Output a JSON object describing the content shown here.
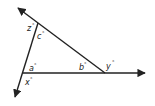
{
  "diagram": {
    "type": "triangle-with-extended-sides",
    "colors": {
      "line": "#222222",
      "background": "#ffffff"
    },
    "vertices": {
      "top": {
        "x": 38,
        "y": 23
      },
      "bottom_left": {
        "x": 23,
        "y": 73
      },
      "right": {
        "x": 105,
        "y": 73
      }
    },
    "rays": {
      "upper_left_arrow": {
        "x": 17,
        "y": 7
      },
      "lower_left_arrow": {
        "x": 14,
        "y": 98
      },
      "right_arrow": {
        "x": 146,
        "y": 73
      }
    },
    "angle_labels": [
      {
        "id": "z",
        "text": "z",
        "degree": "°"
      },
      {
        "id": "c",
        "text": "c",
        "degree": "°"
      },
      {
        "id": "a",
        "text": "a",
        "degree": "°"
      },
      {
        "id": "x",
        "text": "x",
        "degree": "°"
      },
      {
        "id": "b",
        "text": "b",
        "degree": "°"
      },
      {
        "id": "y",
        "text": "y",
        "degree": "°"
      }
    ]
  }
}
